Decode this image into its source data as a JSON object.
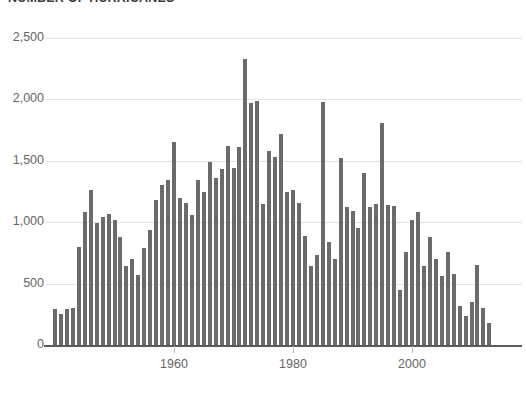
{
  "chart_data": {
    "type": "bar",
    "title": "NUMBER OF HURRICANES",
    "xlabel": "",
    "ylabel": "",
    "xlim": [
      1939,
      2014
    ],
    "ylim": [
      0,
      2500
    ],
    "grid": true,
    "legend": null,
    "bar_color": "#6b6b6b",
    "gridline_color": "#e3e3e3",
    "axis_color": "#5a5a5a",
    "background_color": "#ffffff",
    "ytick_labels": [
      "0",
      "500",
      "1,000",
      "1,500",
      "2,000",
      "2,500"
    ],
    "ytick_values": [
      0,
      500,
      1000,
      1500,
      2000,
      2500
    ],
    "xtick_labels": [
      "1960",
      "1980",
      "2000"
    ],
    "xtick_values": [
      1960,
      1980,
      2000
    ],
    "categories": [
      1940,
      1941,
      1942,
      1943,
      1944,
      1945,
      1946,
      1947,
      1948,
      1949,
      1950,
      1951,
      1952,
      1953,
      1954,
      1955,
      1956,
      1957,
      1958,
      1959,
      1960,
      1961,
      1962,
      1963,
      1964,
      1965,
      1966,
      1967,
      1968,
      1969,
      1970,
      1971,
      1972,
      1973,
      1974,
      1975,
      1976,
      1977,
      1978,
      1979,
      1980,
      1981,
      1982,
      1983,
      1984,
      1985,
      1986,
      1987,
      1988,
      1989,
      1990,
      1991,
      1992,
      1993,
      1994,
      1995,
      1996,
      1997,
      1998,
      1999,
      2000,
      2001,
      2002,
      2003,
      2004,
      2005,
      2006,
      2007,
      2008,
      2009,
      2010,
      2011,
      2012,
      2013
    ],
    "values": [
      290,
      250,
      290,
      300,
      800,
      1080,
      1260,
      990,
      1040,
      1070,
      1020,
      880,
      640,
      700,
      570,
      790,
      940,
      1180,
      1300,
      1340,
      1650,
      1200,
      1160,
      1060,
      1340,
      1250,
      1490,
      1360,
      1430,
      1620,
      1440,
      1610,
      2330,
      1970,
      1990,
      1150,
      1580,
      1530,
      1720,
      1250,
      1260,
      1160,
      890,
      640,
      730,
      1975,
      840,
      700,
      1520,
      1120,
      1090,
      950,
      1400,
      1120,
      1150,
      1810,
      1140,
      1130,
      450,
      760,
      1020,
      1080,
      640,
      880,
      700,
      560,
      760,
      580,
      320,
      240,
      350,
      650,
      300,
      180
    ]
  }
}
